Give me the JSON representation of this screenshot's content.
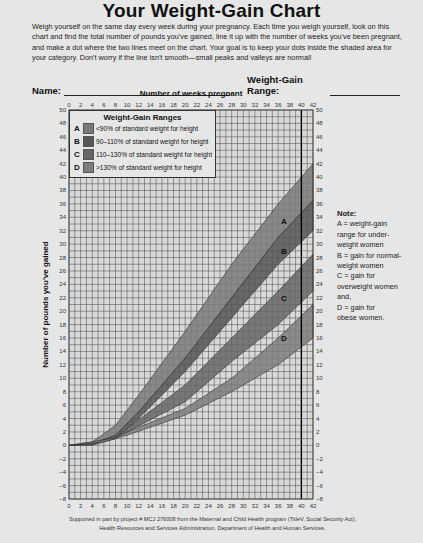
{
  "page": {
    "title": "Your Weight-Gain Chart",
    "intro": "Weigh yourself on the same day every week during your pregnancy. Each time you weigh yourself, look on this chart and find the total number of pounds you've gained, line it up with the number of weeks you've been pregnant, and make a dot where the two lines meet on the chart. Your goal is to keep your dots inside the shaded area for your category. Don't worry if the line isn't smooth—small peaks and valleys are normal!",
    "name_label": "Name:",
    "range_label": "Weight-Gain Range:",
    "note_title": "Note:",
    "note_lines": [
      "A = weight-gain",
      "range for under-",
      "weight women",
      "B = gain for normal-",
      "weight women",
      "C = gain for",
      "overweight women",
      "and,",
      "D = gain for",
      "obese women."
    ],
    "footer_line1": "Supported in part by project # MCJ 276008 from the Maternal and Child Health program (TitleV, Social Security Act),",
    "footer_line2": "Health Resources and Services Administration, Department of Health and Human Services."
  },
  "legend": {
    "title": "Weight-Gain Ranges",
    "items": [
      {
        "key": "A",
        "label": "<90% of standard weight for height",
        "color": "#7a7a7a"
      },
      {
        "key": "B",
        "label": "90–110% of standard weight for height",
        "color": "#555555"
      },
      {
        "key": "C",
        "label": "110–130% of standard weight for height",
        "color": "#666666"
      },
      {
        "key": "D",
        "label": ">130% of standard weight for height",
        "color": "#7d7d7d"
      }
    ]
  },
  "chart_data": {
    "type": "area",
    "title": "Your Weight-Gain Chart",
    "xlabel": "Number of weeks pregnant",
    "ylabel": "Number of pounds you've gained",
    "xlim": [
      0,
      42
    ],
    "ylim": [
      -8,
      50
    ],
    "x_ticks": [
      0,
      2,
      4,
      6,
      8,
      10,
      12,
      14,
      16,
      18,
      20,
      22,
      24,
      26,
      28,
      30,
      32,
      34,
      36,
      38,
      40,
      42
    ],
    "y_ticks": [
      -8,
      -6,
      -4,
      -2,
      0,
      2,
      4,
      6,
      8,
      10,
      12,
      14,
      16,
      18,
      20,
      22,
      24,
      26,
      28,
      30,
      32,
      34,
      36,
      38,
      40,
      42,
      44,
      46,
      48,
      50
    ],
    "grid": true,
    "reference_line_week": 40,
    "legend_position": "top-left inside",
    "series": [
      {
        "name": "A",
        "label": "<90% of standard weight for height",
        "color": "#7a7a7a",
        "upper": [
          [
            0,
            0
          ],
          [
            4,
            0.5
          ],
          [
            8,
            3
          ],
          [
            12,
            7.5
          ],
          [
            20,
            17
          ],
          [
            28,
            27
          ],
          [
            36,
            36
          ],
          [
            42,
            42
          ]
        ],
        "lower": [
          [
            0,
            0
          ],
          [
            4,
            0.2
          ],
          [
            8,
            1.5
          ],
          [
            12,
            5
          ],
          [
            20,
            13
          ],
          [
            28,
            22
          ],
          [
            36,
            31
          ],
          [
            42,
            36.5
          ]
        ],
        "label_at": [
          37,
          33
        ]
      },
      {
        "name": "B",
        "label": "90–110% of standard weight for height",
        "color": "#555555",
        "upper": [
          [
            0,
            0
          ],
          [
            4,
            0.2
          ],
          [
            8,
            1.5
          ],
          [
            12,
            5
          ],
          [
            20,
            13
          ],
          [
            28,
            22
          ],
          [
            36,
            31
          ],
          [
            42,
            36.5
          ]
        ],
        "lower": [
          [
            0,
            0
          ],
          [
            4,
            0
          ],
          [
            8,
            1
          ],
          [
            12,
            4
          ],
          [
            20,
            11
          ],
          [
            28,
            19
          ],
          [
            36,
            27
          ],
          [
            42,
            32
          ]
        ],
        "label_at": [
          37,
          28.5
        ]
      },
      {
        "name": "C",
        "label": "110–130% of standard weight for height",
        "color": "#666666",
        "upper": [
          [
            8,
            1.2
          ],
          [
            10,
            2.5
          ],
          [
            20,
            9
          ],
          [
            28,
            16
          ],
          [
            36,
            23
          ],
          [
            42,
            28.5
          ]
        ],
        "lower": [
          [
            8,
            1.1
          ],
          [
            10,
            2
          ],
          [
            20,
            6.5
          ],
          [
            28,
            12.5
          ],
          [
            36,
            18
          ],
          [
            42,
            23
          ]
        ],
        "label_at": [
          37,
          21.5
        ]
      },
      {
        "name": "D",
        "label": ">130% of standard weight for height",
        "color": "#7d7d7d",
        "upper": [
          [
            8,
            1.1
          ],
          [
            10,
            2
          ],
          [
            20,
            5.5
          ],
          [
            28,
            10
          ],
          [
            36,
            16
          ],
          [
            42,
            21
          ]
        ],
        "lower": [
          [
            0,
            0
          ],
          [
            6,
            0.5
          ],
          [
            10,
            1.5
          ],
          [
            20,
            4.5
          ],
          [
            28,
            8
          ],
          [
            36,
            12
          ],
          [
            42,
            16
          ]
        ],
        "label_at": [
          37,
          15.5
        ]
      }
    ]
  }
}
